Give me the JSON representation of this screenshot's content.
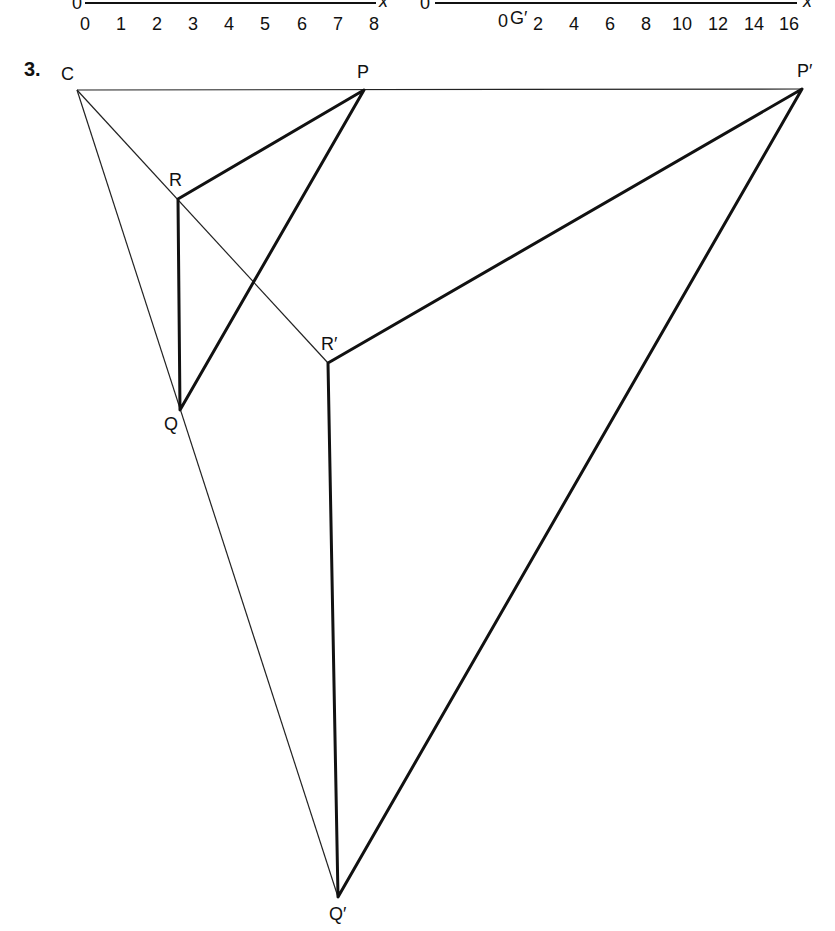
{
  "top_axes": {
    "left": {
      "origin_label": "0",
      "axis_label": "x",
      "ticks": [
        "0",
        "1",
        "2",
        "3",
        "4",
        "5",
        "6",
        "7",
        "8"
      ]
    },
    "right": {
      "origin_label": "0",
      "axis_label": "x",
      "ticks": [
        "0",
        "2",
        "4",
        "6",
        "8",
        "10",
        "12",
        "14",
        "16"
      ],
      "point_label": "G′"
    }
  },
  "question": {
    "number": "3.",
    "vertices": {
      "C": "C",
      "P": "P",
      "R": "R",
      "Q": "Q",
      "P_prime": "P′",
      "R_prime": "R′",
      "Q_prime": "Q′"
    },
    "original_triangle": [
      "P",
      "Q",
      "R"
    ],
    "image_triangle": [
      "P′",
      "Q′",
      "R′"
    ],
    "centre_of_enlargement": "C"
  }
}
